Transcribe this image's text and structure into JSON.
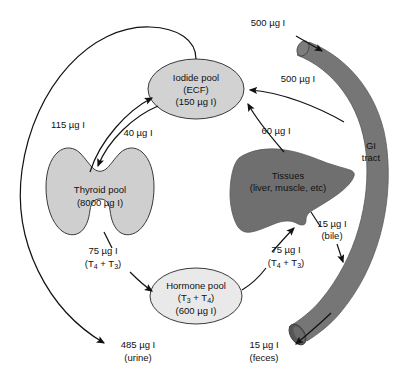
{
  "diagram": {
    "colors": {
      "iodide_pool_fill": "#d2d2d2",
      "thyroid_pool_fill": "#cfcfcf",
      "hormone_pool_fill": "#e9e9e9",
      "tissues_fill": "#6f6f6f",
      "gi_tract_fill": "#767676",
      "gi_tract_lumen_fill": "#555555",
      "outline": "#3a3a3a",
      "arrow": "#111111",
      "text": "#111111",
      "background": "#ffffff"
    },
    "nodes": [
      {
        "id": "iodide-pool",
        "shape": "ellipse",
        "lines": [
          "Iodide pool",
          "(ECF)",
          "(150 µg I)"
        ]
      },
      {
        "id": "thyroid-pool",
        "shape": "thyroid-gland",
        "lines": [
          "Thyroid pool",
          "(8000 µg I)"
        ]
      },
      {
        "id": "hormone-pool",
        "shape": "ellipse",
        "lines_rich": [
          {
            "text": "Hormone pool"
          },
          {
            "text": "(T",
            "sub": "3",
            "text2": " + T",
            "sub2": "4",
            "text3": ")"
          },
          {
            "text": "(600 µg I)"
          }
        ],
        "lines": [
          "Hormone pool",
          "(T3 + T4)",
          "(600 µg I)"
        ]
      },
      {
        "id": "tissues",
        "shape": "liver",
        "lines": [
          "Tissues",
          "(liver, muscle, etc)"
        ]
      },
      {
        "id": "gi-tract",
        "shape": "curved-tube",
        "lines": [
          "GI",
          "tract"
        ]
      }
    ],
    "flows": [
      {
        "id": "gi-intake",
        "lines": [
          "500 µg I"
        ],
        "from": "dietary-intake",
        "to": "gi-tract"
      },
      {
        "id": "gi-to-iodide",
        "lines": [
          "500 µg I"
        ],
        "from": "gi-tract",
        "to": "iodide-pool"
      },
      {
        "id": "tissues-to-iodide",
        "lines": [
          "60 µg I"
        ],
        "from": "tissues",
        "to": "iodide-pool"
      },
      {
        "id": "thyroid-to-iodide",
        "lines": [
          "115 µg I"
        ],
        "from": "thyroid-pool",
        "to": "iodide-pool"
      },
      {
        "id": "iodide-to-thyroid",
        "lines": [
          "40 µg I"
        ],
        "from": "iodide-pool",
        "to": "thyroid-pool"
      },
      {
        "id": "thyroid-to-hormone",
        "lines": [
          "75 µg I",
          "(T4 + T3)"
        ],
        "rich": {
          "value": "75 µg I",
          "formula_pre": "(T",
          "formula_sub1": "4",
          "formula_mid": " + T",
          "formula_sub2": "3",
          "formula_post": ")"
        },
        "from": "thyroid-pool",
        "to": "hormone-pool"
      },
      {
        "id": "hormone-to-tissues",
        "lines": [
          "75 µg I",
          "(T4 + T3)"
        ],
        "rich": {
          "value": "75 µg I",
          "formula_pre": "(T",
          "formula_sub1": "4",
          "formula_mid": " + T",
          "formula_sub2": "3",
          "formula_post": ")"
        },
        "from": "hormone-pool",
        "to": "tissues"
      },
      {
        "id": "tissues-to-gi-bile",
        "lines": [
          "15 µg I",
          "(bile)"
        ],
        "from": "tissues",
        "to": "gi-tract"
      },
      {
        "id": "iodide-to-urine",
        "lines": [
          "485 µg I",
          "(urine)"
        ],
        "from": "iodide-pool",
        "to": "urine-excretion"
      },
      {
        "id": "gi-to-feces",
        "lines": [
          "15 µg I",
          "(feces)"
        ],
        "from": "gi-tract",
        "to": "feces-excretion"
      }
    ]
  }
}
